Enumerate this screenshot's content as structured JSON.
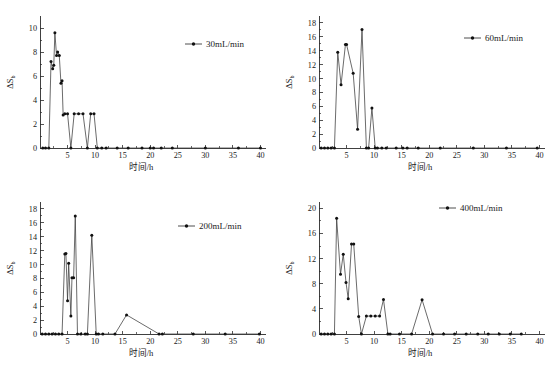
{
  "figure": {
    "panel_count": 4,
    "x_axis_label": "时间/h",
    "y_axis_label_main": "ΔS",
    "y_axis_label_sub": "b",
    "marker_color": "#111111",
    "line_color": "#3a3a3a",
    "axis_color": "#2b2b2b"
  },
  "chart_data": [
    {
      "type": "line",
      "title": "",
      "legend": "30mL/min",
      "legend_position": "top-right",
      "xlabel": "时间/h",
      "ylabel": "ΔSb",
      "xlim": [
        0,
        41
      ],
      "ylim": [
        0,
        11
      ],
      "xticks": [
        5,
        10,
        15,
        20,
        25,
        30,
        35,
        40
      ],
      "yticks": [
        0,
        2,
        4,
        6,
        8,
        10
      ],
      "grid": false,
      "x": [
        0.5,
        1.0,
        1.6,
        2.0,
        2.3,
        2.5,
        2.7,
        3.0,
        3.2,
        3.5,
        3.8,
        4.0,
        4.2,
        4.5,
        5.0,
        5.6,
        6.2,
        7.0,
        7.8,
        8.6,
        9.2,
        9.8,
        10.4,
        11.2,
        12.0,
        14.0,
        16.0,
        18.5,
        20.0,
        20.6,
        22.0,
        24.0,
        30.0,
        36.0,
        40.0
      ],
      "y": [
        0,
        0,
        0,
        7.2,
        6.6,
        6.9,
        9.6,
        7.7,
        8.0,
        7.7,
        5.4,
        5.6,
        2.75,
        2.85,
        2.85,
        0,
        2.85,
        2.85,
        2.85,
        0,
        2.85,
        2.85,
        0,
        0,
        0,
        0,
        0,
        0,
        0,
        0,
        0,
        0,
        0,
        0,
        0
      ]
    },
    {
      "type": "line",
      "title": "",
      "legend": "60mL/min",
      "legend_position": "top-right",
      "xlabel": "时间/h",
      "ylabel": "ΔSb",
      "xlim": [
        0,
        41
      ],
      "ylim": [
        0,
        19
      ],
      "xticks": [
        5,
        10,
        15,
        20,
        25,
        30,
        35,
        40
      ],
      "yticks": [
        0,
        2,
        4,
        6,
        8,
        10,
        12,
        14,
        16,
        18
      ],
      "grid": false,
      "x": [
        0.4,
        1.0,
        1.6,
        2.2,
        2.8,
        3.4,
        4.0,
        4.8,
        5.0,
        6.2,
        7.0,
        7.8,
        8.6,
        9.0,
        9.6,
        10.2,
        10.6,
        11.4,
        12.2,
        14.0,
        15.2,
        16.0,
        18.0,
        22.0,
        28.0,
        34.0,
        39.6
      ],
      "y": [
        0,
        0,
        0,
        0,
        0,
        13.8,
        9.1,
        14.9,
        14.9,
        10.75,
        2.7,
        17.05,
        0,
        0,
        5.75,
        0,
        0,
        0,
        0,
        0,
        0,
        0,
        0,
        0,
        0,
        0,
        0
      ]
    },
    {
      "type": "line",
      "title": "",
      "legend": "200mL/min",
      "legend_position": "top-right",
      "xlabel": "时间/h",
      "ylabel": "ΔSb",
      "xlim": [
        0,
        41
      ],
      "ylim": [
        0,
        19
      ],
      "xticks": [
        5,
        10,
        15,
        20,
        25,
        30,
        35,
        40
      ],
      "yticks": [
        0,
        2,
        4,
        6,
        8,
        10,
        12,
        14,
        16,
        18
      ],
      "grid": false,
      "x": [
        0.4,
        1.0,
        1.6,
        2.2,
        2.8,
        3.4,
        4.0,
        4.5,
        4.7,
        5.0,
        5.2,
        5.6,
        5.8,
        6.1,
        6.4,
        6.8,
        7.4,
        8.2,
        8.6,
        9.4,
        10.2,
        10.6,
        11.4,
        13.6,
        15.7,
        21.6,
        22.2,
        27.8,
        33.6,
        39.8
      ],
      "y": [
        0,
        0,
        0,
        0,
        0,
        0,
        0,
        11.5,
        11.6,
        4.8,
        10.2,
        2.6,
        8.1,
        8.1,
        17.0,
        0,
        0,
        0,
        0,
        14.2,
        0,
        0,
        0,
        0,
        2.75,
        0,
        0,
        0,
        0,
        0
      ]
    },
    {
      "type": "line",
      "title": "",
      "legend": "400mL/min",
      "legend_position": "top-right",
      "xlabel": "时间/h",
      "ylabel": "ΔSb",
      "xlim": [
        0,
        41
      ],
      "ylim": [
        0,
        21
      ],
      "xticks": [
        5,
        10,
        15,
        20,
        25,
        30,
        35,
        40
      ],
      "yticks": [
        0,
        4,
        8,
        12,
        16,
        20
      ],
      "grid": false,
      "x": [
        0.4,
        1.0,
        1.6,
        2.2,
        2.8,
        3.2,
        3.9,
        4.4,
        4.9,
        5.3,
        5.9,
        6.3,
        7.2,
        7.7,
        8.6,
        9.4,
        10.2,
        11.0,
        11.7,
        12.5,
        12.9,
        14.6,
        16.8,
        18.7,
        20.6,
        22.6,
        24.6,
        26.7,
        28.8,
        30.7,
        32.7,
        34.7,
        36.7
      ],
      "y": [
        0,
        0,
        0,
        0,
        0,
        18.4,
        9.5,
        12.7,
        8.2,
        5.6,
        14.3,
        14.3,
        2.8,
        0,
        2.85,
        2.85,
        2.85,
        2.85,
        5.5,
        0,
        0,
        0,
        0,
        5.45,
        0,
        0,
        0,
        0,
        0,
        0,
        0,
        0,
        0
      ]
    }
  ]
}
